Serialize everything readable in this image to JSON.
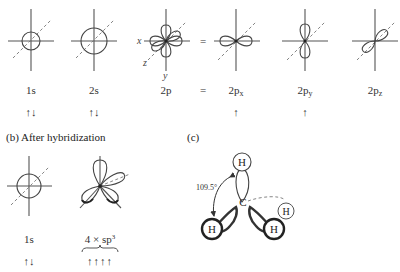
{
  "section_a": {
    "orbitals": [
      {
        "label": "1s",
        "electrons": "↑↓"
      },
      {
        "label": "2s",
        "electrons": "↑↓"
      },
      {
        "label": "2p",
        "electrons": ""
      },
      {
        "label": "2px",
        "main": "2p",
        "sub": "x",
        "electrons": "↑"
      },
      {
        "label": "2py",
        "main": "2p",
        "sub": "y",
        "electrons": "↑"
      },
      {
        "label": "2pz",
        "main": "2p",
        "sub": "z",
        "electrons": ""
      }
    ],
    "equals": "=",
    "axis_labels": {
      "x": "x",
      "y": "y",
      "z": "z"
    }
  },
  "section_b": {
    "heading": "(b) After hybridization",
    "orbitals": [
      {
        "label": "1s",
        "electrons": "↑↓"
      },
      {
        "label": "4 × sp",
        "sup": "3",
        "electrons": "↑↑↑↑"
      }
    ]
  },
  "section_c": {
    "heading": "(c)",
    "angle": "109.5°",
    "center_atom": "C",
    "atoms": [
      "H",
      "H",
      "H",
      "H"
    ]
  }
}
